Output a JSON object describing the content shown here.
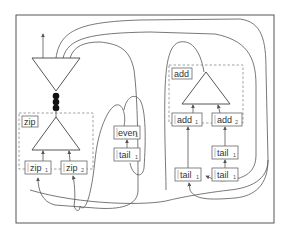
{
  "diagram": {
    "frame": {
      "x": 16,
      "y": 15,
      "w": 258,
      "h": 208
    },
    "colors": {
      "stroke": "#444444",
      "dashed": "#888888",
      "dot": "#111111"
    },
    "top_node": {
      "shape": "inverted-triangle",
      "role": "merge",
      "dots": 3
    },
    "zip_group": {
      "label": "zip",
      "nodes": [
        {
          "name": "zip",
          "sub": "1"
        },
        {
          "name": "zip",
          "sub": "2"
        }
      ]
    },
    "even_chain": {
      "nodes": [
        {
          "name": "even",
          "sub": "1"
        },
        {
          "name": "tail",
          "sub": "1"
        }
      ]
    },
    "add_group": {
      "label": "add",
      "nodes": [
        {
          "name": "add",
          "sub": "1"
        },
        {
          "name": "add",
          "sub": "2"
        }
      ]
    },
    "add_right_chain": {
      "nodes": [
        {
          "name": "tail",
          "sub": "1"
        },
        {
          "name": "tail",
          "sub": "1"
        }
      ]
    },
    "add_left_chain": {
      "nodes": [
        {
          "name": "tail",
          "sub": "1"
        }
      ]
    }
  }
}
